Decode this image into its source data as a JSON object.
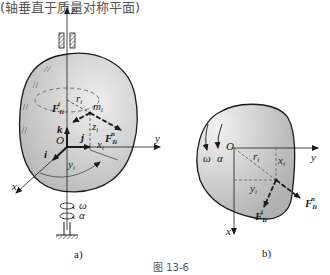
{
  "header_fragment": "(轴垂直于质量对称平面)",
  "figure_caption": "图 13-6",
  "colors": {
    "body_fill": "#c9c9c9",
    "body_fill_light": "#e6e6e6",
    "line": "#1a1a1a",
    "dashed": "#555555"
  },
  "panel_a": {
    "caption": "a)",
    "axes": {
      "x": "x",
      "y": "y",
      "z": "z"
    },
    "origin": "O",
    "unit_vectors": {
      "i": "i",
      "j": "j",
      "k": "k"
    },
    "point": "m",
    "point_sub": "i",
    "radius": "r",
    "radius_sub": "i",
    "coords": {
      "x": "x",
      "y": "y",
      "z": "z",
      "sub": "i"
    },
    "force_tangential": "F",
    "force_tangential_sub": "Ii",
    "force_tangential_sup": "t",
    "force_normal": "F",
    "force_normal_sub": "Ii",
    "force_normal_sup": "n",
    "omega": "ω",
    "alpha": "α"
  },
  "panel_b": {
    "caption": "b)",
    "axes": {
      "x": "x",
      "y": "y"
    },
    "origin": "O",
    "radius": "r",
    "radius_sub": "i",
    "coords": {
      "x": "x",
      "y": "y",
      "sub": "i"
    },
    "force_tangential": "F",
    "force_tangential_sub": "Ii",
    "force_tangential_sup": "t",
    "force_normal": "F",
    "force_normal_sub": "Ii",
    "force_normal_sup": "n",
    "omega": "ω",
    "alpha": "α"
  }
}
